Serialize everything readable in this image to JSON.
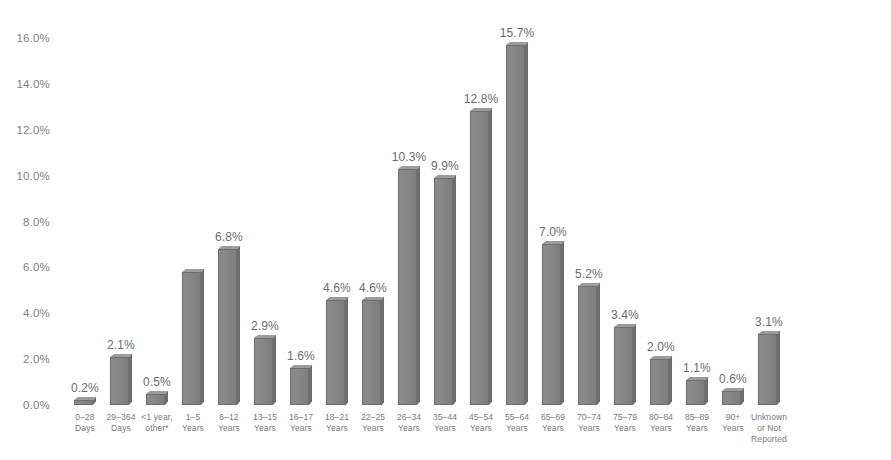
{
  "chart_data": {
    "type": "bar",
    "title": "",
    "subtitle": "",
    "xlabel": "",
    "ylabel": "",
    "ylim": [
      0,
      16
    ],
    "ytick_step": 2,
    "grid": false,
    "legend": "none",
    "bar_color": "#878787",
    "label_color": "#6b6b6b",
    "axis_text_color": "#808080",
    "value_suffix": "%",
    "ytick_labels": [
      "0.0%",
      "2.0%",
      "4.0%",
      "6.0%",
      "8.0%",
      "10.0%",
      "12.0%",
      "14.0%",
      "16.0%"
    ],
    "ytick_values": [
      0,
      2,
      4,
      6,
      8,
      10,
      12,
      14,
      16
    ],
    "categories": [
      "0–28 Days",
      "29–364 Days",
      "<1 year, other*",
      "1–5 Years",
      "6–12 Years",
      "13–15 Years",
      "16–17 Years",
      "18–21 Years",
      "22–25 Years",
      "26–34 Years",
      "35–44 Years",
      "45–54 Years",
      "55–64 Years",
      "65–69 Years",
      "70–74 Years",
      "75–79 Years",
      "80–84 Years",
      "85–89 Years",
      "90+ Years",
      "Unknown or Not Reported"
    ],
    "values": [
      0.2,
      2.1,
      0.5,
      5.8,
      6.8,
      2.9,
      1.6,
      4.6,
      4.6,
      10.3,
      9.9,
      12.8,
      15.7,
      7.0,
      5.2,
      3.4,
      2.0,
      1.1,
      0.6,
      3.1
    ],
    "data_labels": [
      "0.2%",
      "2.1%",
      "0.5%",
      "",
      "6.8%",
      "2.9%",
      "1.6%",
      "4.6%",
      "4.6%",
      "10.3%",
      "9.9%",
      "12.8%",
      "15.7%",
      "7.0%",
      "5.2%",
      "3.4%",
      "2.0%",
      "1.1%",
      "0.6%",
      "3.1%"
    ],
    "bars": [
      {
        "category_lines": [
          "0–28",
          "Days"
        ],
        "value": 0.2,
        "label": "0.2%"
      },
      {
        "category_lines": [
          "29–364",
          "Days"
        ],
        "value": 2.1,
        "label": "2.1%"
      },
      {
        "category_lines": [
          "<1 year,",
          "other*"
        ],
        "value": 0.5,
        "label": "0.5%"
      },
      {
        "category_lines": [
          "1–5",
          "Years"
        ],
        "value": 5.8,
        "label": ""
      },
      {
        "category_lines": [
          "6–12",
          "Years"
        ],
        "value": 6.8,
        "label": "6.8%"
      },
      {
        "category_lines": [
          "13–15",
          "Years"
        ],
        "value": 2.9,
        "label": "2.9%"
      },
      {
        "category_lines": [
          "16–17",
          "Years"
        ],
        "value": 1.6,
        "label": "1.6%"
      },
      {
        "category_lines": [
          "18–21",
          "Years"
        ],
        "value": 4.6,
        "label": "4.6%"
      },
      {
        "category_lines": [
          "22–25",
          "Years"
        ],
        "value": 4.6,
        "label": "4.6%"
      },
      {
        "category_lines": [
          "26–34",
          "Years"
        ],
        "value": 10.3,
        "label": "10.3%"
      },
      {
        "category_lines": [
          "35–44",
          "Years"
        ],
        "value": 9.9,
        "label": "9.9%"
      },
      {
        "category_lines": [
          "45–54",
          "Years"
        ],
        "value": 12.8,
        "label": "12.8%"
      },
      {
        "category_lines": [
          "55–64",
          "Years"
        ],
        "value": 15.7,
        "label": "15.7%"
      },
      {
        "category_lines": [
          "65–69",
          "Years"
        ],
        "value": 7.0,
        "label": "7.0%"
      },
      {
        "category_lines": [
          "70–74",
          "Years"
        ],
        "value": 5.2,
        "label": "5.2%"
      },
      {
        "category_lines": [
          "75–79",
          "Years"
        ],
        "value": 3.4,
        "label": "3.4%"
      },
      {
        "category_lines": [
          "80–84",
          "Years"
        ],
        "value": 2.0,
        "label": "2.0%"
      },
      {
        "category_lines": [
          "85–89",
          "Years"
        ],
        "value": 1.1,
        "label": "1.1%"
      },
      {
        "category_lines": [
          "90+",
          "Years"
        ],
        "value": 0.6,
        "label": "0.6%"
      },
      {
        "category_lines": [
          "Unknown",
          "or Not",
          "Reported"
        ],
        "value": 3.1,
        "label": "3.1%"
      }
    ]
  }
}
